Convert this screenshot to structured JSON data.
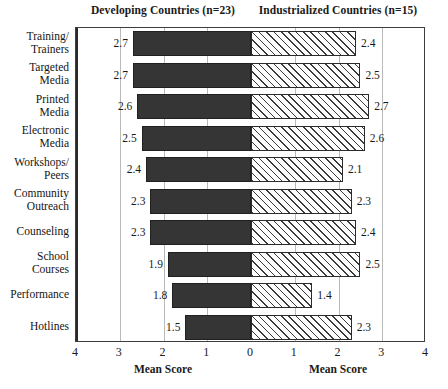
{
  "header": {
    "left_title": "Developing Countries (n=23)",
    "right_title": "Industrialized Countries (n=15)"
  },
  "axis": {
    "left_title": "Mean Score",
    "right_title": "Mean Score",
    "tick_labels": [
      "4",
      "3",
      "2",
      "1",
      "0",
      "1",
      "2",
      "3",
      "4"
    ],
    "min": 0,
    "max": 4
  },
  "chart_data": {
    "type": "bar",
    "orientation": "horizontal",
    "style": "diverging-population-pyramid",
    "title": "",
    "xlabel": "Mean Score",
    "ylabel": "",
    "xlim": [
      0,
      4
    ],
    "grid": true,
    "legend_position": "top",
    "categories": [
      "Training/\nTrainers",
      "Targeted\nMedia",
      "Printed\nMedia",
      "Electronic\nMedia",
      "Workshops/\nPeers",
      "Community\nOutreach",
      "Counseling",
      "School\nCourses",
      "Performance",
      "Hotlines"
    ],
    "series": [
      {
        "name": "Developing Countries (n=23)",
        "side": "left",
        "fill": "solid-dark",
        "color": "#353535",
        "values": [
          2.7,
          2.7,
          2.6,
          2.5,
          2.4,
          2.3,
          2.3,
          1.9,
          1.8,
          1.5
        ]
      },
      {
        "name": "Industrialized Countries (n=15)",
        "side": "right",
        "fill": "diagonal-hatch",
        "color": "#ffffff",
        "values": [
          2.4,
          2.5,
          2.7,
          2.6,
          2.1,
          2.3,
          2.4,
          2.5,
          1.4,
          2.3
        ]
      }
    ],
    "rows": [
      {
        "label_line1": "Training/",
        "label_line2": "Trainers",
        "left": 2.7,
        "right": 2.4,
        "left_text": "2.7",
        "right_text": "2.4"
      },
      {
        "label_line1": "Targeted",
        "label_line2": "Media",
        "left": 2.7,
        "right": 2.5,
        "left_text": "2.7",
        "right_text": "2.5"
      },
      {
        "label_line1": "Printed",
        "label_line2": "Media",
        "left": 2.6,
        "right": 2.7,
        "left_text": "2.6",
        "right_text": "2.7"
      },
      {
        "label_line1": "Electronic",
        "label_line2": "Media",
        "left": 2.5,
        "right": 2.6,
        "left_text": "2.5",
        "right_text": "2.6"
      },
      {
        "label_line1": "Workshops/",
        "label_line2": "Peers",
        "left": 2.4,
        "right": 2.1,
        "left_text": "2.4",
        "right_text": "2.1"
      },
      {
        "label_line1": "Community",
        "label_line2": "Outreach",
        "left": 2.3,
        "right": 2.3,
        "left_text": "2.3",
        "right_text": "2.3"
      },
      {
        "label_line1": "Counseling",
        "label_line2": "",
        "left": 2.3,
        "right": 2.4,
        "left_text": "2.3",
        "right_text": "2.4"
      },
      {
        "label_line1": "School",
        "label_line2": "Courses",
        "left": 1.9,
        "right": 2.5,
        "left_text": "1.9",
        "right_text": "2.5"
      },
      {
        "label_line1": "Performance",
        "label_line2": "",
        "left": 1.8,
        "right": 1.4,
        "left_text": "1.8",
        "right_text": "1.4"
      },
      {
        "label_line1": "Hotlines",
        "label_line2": "",
        "left": 1.5,
        "right": 2.3,
        "left_text": "1.5",
        "right_text": "2.3"
      }
    ]
  }
}
